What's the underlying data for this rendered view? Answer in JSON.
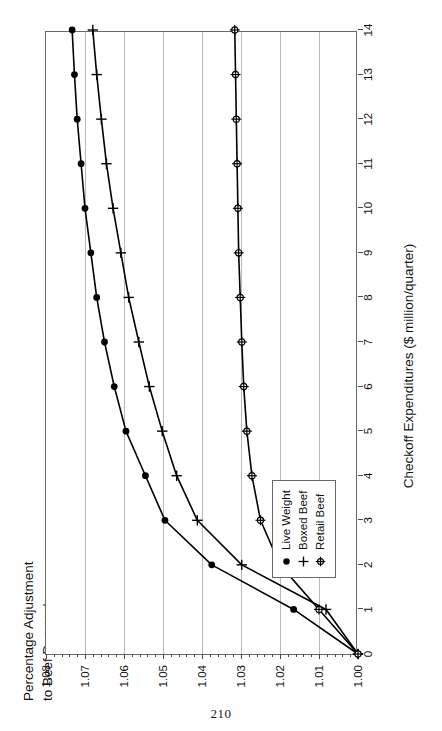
{
  "page": {
    "number": "210"
  },
  "chart_data": {
    "type": "line",
    "title": "",
    "xlabel": "Checkoff Expenditures ($ million/quarter)",
    "ylabel": "Percentage Adjustment\nto Beef Demand",
    "ylabel_line1": "Percentage Adjustment",
    "ylabel_line2": "to Beef Demand",
    "x": [
      0,
      1,
      2,
      3,
      4,
      5,
      6,
      7,
      8,
      9,
      10,
      11,
      12,
      13,
      14
    ],
    "xlim": [
      0,
      14
    ],
    "ylim": [
      1.0,
      1.08
    ],
    "xticks": [
      0,
      1,
      2,
      3,
      4,
      5,
      6,
      7,
      8,
      9,
      10,
      11,
      12,
      13,
      14
    ],
    "xticklabels": [
      "0",
      "1",
      "2",
      "3",
      "4",
      "5",
      "6",
      "7",
      "8",
      "9",
      "10",
      "11",
      "12",
      "13",
      "14"
    ],
    "yticks": [
      1.0,
      1.01,
      1.02,
      1.03,
      1.04,
      1.05,
      1.06,
      1.07,
      1.08
    ],
    "yticklabels": [
      "1.00",
      "1.01",
      "1.02",
      "1.03",
      "1.04",
      "1.05",
      "1.06",
      "1.07",
      "1.08"
    ],
    "y_minor_tick_step": 0.002,
    "grid": "y-major-only",
    "legend_position": "lower-left-inside",
    "series": [
      {
        "name": "Live Weight",
        "marker": "filled-circle",
        "color": "#000000",
        "values": [
          1.0,
          1.0165,
          1.0375,
          1.0495,
          1.0545,
          1.0595,
          1.0625,
          1.065,
          1.067,
          1.0685,
          1.07,
          1.071,
          1.072,
          1.0727,
          1.0733
        ]
      },
      {
        "name": "Boxed Beef",
        "marker": "plus",
        "color": "#000000",
        "values": [
          1.0,
          1.0082,
          1.0298,
          1.0412,
          1.0465,
          1.0502,
          1.0535,
          1.0562,
          1.0588,
          1.0608,
          1.0628,
          1.0645,
          1.0658,
          1.067,
          1.068
        ]
      },
      {
        "name": "Retail Beef",
        "marker": "circle-spoked",
        "color": "#000000",
        "values": [
          1.0,
          1.01,
          1.02,
          1.025,
          1.0272,
          1.0285,
          1.0293,
          1.0298,
          1.0302,
          1.0306,
          1.0308,
          1.031,
          1.0312,
          1.0314,
          1.0316
        ]
      }
    ]
  }
}
